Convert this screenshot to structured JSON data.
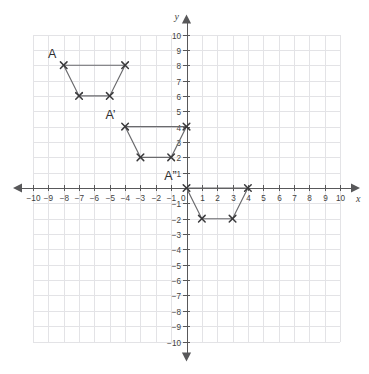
{
  "figure": {
    "title": "",
    "background_color": "#ffffff",
    "grid_color": "#e3e3e6",
    "axis_color": "#58585a",
    "shape_line_color": "#6a6a6d",
    "marker_color": "#3a3a3c"
  },
  "axes": {
    "x_axis_label": "x",
    "y_axis_label": "y",
    "x_min": -10,
    "x_max": 10,
    "y_min": -10,
    "y_max": 10,
    "x_tick_labels": [
      "-10",
      "-9",
      "-8",
      "-7",
      "-6",
      "-5",
      "-4",
      "-3",
      "-2",
      "-1",
      "0",
      "1",
      "2",
      "3",
      "4",
      "5",
      "6",
      "7",
      "8",
      "9",
      "10"
    ],
    "y_tick_labels": [
      "10",
      "9",
      "8",
      "7",
      "6",
      "5",
      "4",
      "3",
      "2",
      "1",
      "-1",
      "-2",
      "-3",
      "-4",
      "-5",
      "-6",
      "-7",
      "-8",
      "-9",
      "-10"
    ],
    "origin_label": "0",
    "grid_on": true,
    "grid_step": 1
  },
  "chart_data": {
    "type": "scatter",
    "title": "",
    "xlabel": "x",
    "ylabel": "y",
    "xlim": [
      -10,
      10
    ],
    "ylim": [
      -10,
      10
    ],
    "grid": true,
    "legend": "none",
    "series": [
      {
        "name": "A",
        "label": "A",
        "label_position": {
          "x": -8.75,
          "y": 8.5
        },
        "closed": true,
        "points": [
          {
            "x": -8,
            "y": 8
          },
          {
            "x": -4,
            "y": 8
          },
          {
            "x": -5,
            "y": 6
          },
          {
            "x": -7,
            "y": 6
          }
        ]
      },
      {
        "name": "A-prime",
        "label": "A’",
        "label_position": {
          "x": -4.95,
          "y": 4.5
        },
        "closed": true,
        "points": [
          {
            "x": -4,
            "y": 4
          },
          {
            "x": 0,
            "y": 4
          },
          {
            "x": -1,
            "y": 2
          },
          {
            "x": -3,
            "y": 2
          }
        ]
      },
      {
        "name": "A-double-prime",
        "label": "A”",
        "label_position": {
          "x": -1.05,
          "y": 0.55
        },
        "closed": true,
        "points": [
          {
            "x": 0,
            "y": 0
          },
          {
            "x": 4,
            "y": 0
          },
          {
            "x": 3,
            "y": -2
          },
          {
            "x": 1,
            "y": -2
          }
        ]
      }
    ]
  }
}
